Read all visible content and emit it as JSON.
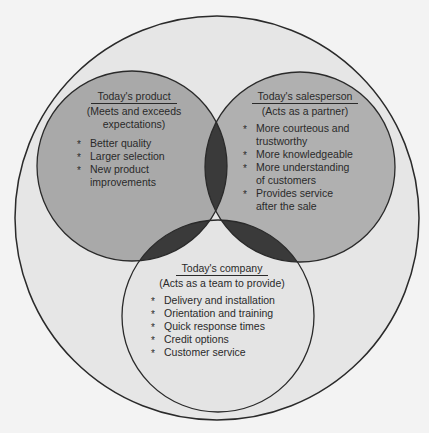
{
  "colors": {
    "background": "#f3f3f3",
    "outer_circle": "#e6e6e6",
    "product_circle": "#a9a9a9",
    "salesperson_circle": "#b0b0b0",
    "company_circle": "#e4e4e4",
    "overlap": "#3a3a3a",
    "stroke": "#2a2a2a"
  },
  "circles": {
    "outer": {
      "cx": 217,
      "cy": 218,
      "r": 202
    },
    "product": {
      "cx": 132,
      "cy": 166,
      "r": 95
    },
    "salesperson": {
      "cx": 300,
      "cy": 167,
      "r": 95
    },
    "company": {
      "cx": 218,
      "cy": 316,
      "r": 96
    }
  },
  "product": {
    "title": "Today's product",
    "subtitle_lines": [
      "(Meets and exceeds",
      "expectations)"
    ],
    "subtitle": "(Meets and exceeds expectations)",
    "items": [
      "Better quality",
      "Larger selection",
      "New product improvements"
    ]
  },
  "salesperson": {
    "title": "Today's salesperson",
    "subtitle": "(Acts as a partner)",
    "items": [
      "More courteous and trustworthy",
      "More knowledgeable",
      "More understanding of customers",
      "Provides service after the sale"
    ]
  },
  "company": {
    "title": "Today's company",
    "subtitle": "(Acts as a team to provide)",
    "items": [
      "Delivery and installation",
      "Orientation and training",
      "Quick response times",
      "Credit options",
      "Customer service"
    ]
  }
}
